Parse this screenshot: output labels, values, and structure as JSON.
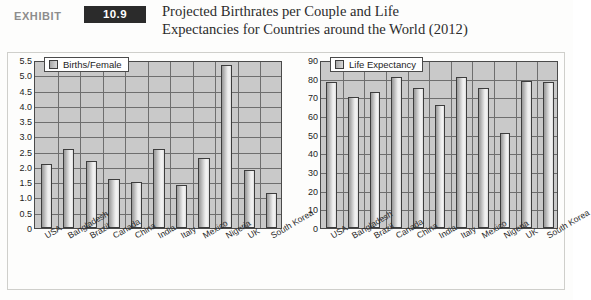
{
  "header": {
    "exhibit_word": "EXHIBIT",
    "exhibit_number": "10.9",
    "title_line_1": "Projected Birthrates per Couple and Life",
    "title_line_2": "Expectancies for Countries around the World (2012)"
  },
  "colors": {
    "badge_background": "#2b2b2b",
    "badge_text": "#ffffff",
    "exhibit_word": "#8d8d8d",
    "title_text": "#2c2c2c",
    "plot_background": "#c9c9c9",
    "gridline": "#6e6e6e",
    "bar_border": "#3d3d3d",
    "bar_fill_light": "#f4f4f4",
    "bar_fill_dark": "#9a9a9a",
    "frame_border": "#cfcfcb",
    "page_background": "#fdfdfc"
  },
  "chart_data": [
    {
      "type": "bar",
      "title": "",
      "xlabel": "",
      "ylabel": "",
      "legend": "Births/Female",
      "legend_position": "top-left",
      "grid": true,
      "ylim": [
        0,
        5.5
      ],
      "yticks": [
        "0",
        "0.5",
        "1.0",
        "1.5",
        "2.0",
        "2.5",
        "3.0",
        "3.5",
        "4.0",
        "4.5",
        "5.0",
        "5.5"
      ],
      "categories": [
        "USA",
        "Bangladesh",
        "Brazil",
        "Canada",
        "China",
        "India",
        "Italy",
        "Mexico",
        "Nigeria",
        "UK",
        "South Korea"
      ],
      "values": [
        2.1,
        2.6,
        2.2,
        1.6,
        1.5,
        2.6,
        1.4,
        2.3,
        5.35,
        1.9,
        1.15
      ]
    },
    {
      "type": "bar",
      "title": "",
      "xlabel": "",
      "ylabel": "",
      "legend": "Life Expectancy",
      "legend_position": "top-left",
      "grid": true,
      "ylim": [
        0,
        90
      ],
      "yticks": [
        "0",
        "10",
        "20",
        "30",
        "40",
        "50",
        "60",
        "70",
        "80",
        "90"
      ],
      "categories": [
        "USA",
        "Bangladesh",
        "Brazil",
        "Canada",
        "China",
        "India",
        "Italy",
        "Mexico",
        "Nigeria",
        "UK",
        "South Korea"
      ],
      "values": [
        78,
        70,
        73,
        81,
        75,
        66,
        81,
        75,
        51,
        79,
        78
      ]
    }
  ]
}
